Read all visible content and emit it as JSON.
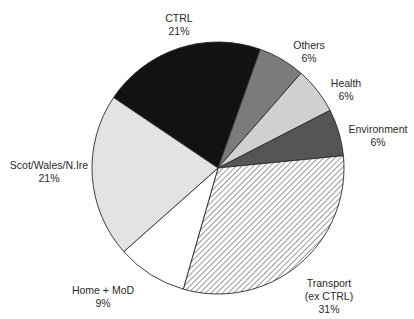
{
  "chart_data": {
    "type": "pie",
    "title": "",
    "start_angle_deg": 304,
    "direction": "clockwise",
    "slices": [
      {
        "label": "CTRL",
        "value": 21,
        "display": "21%",
        "color": "#121212",
        "pattern": "solid"
      },
      {
        "label": "Others",
        "value": 6,
        "display": "6%",
        "color": "#7b7b7b",
        "pattern": "solid"
      },
      {
        "label": "Health",
        "value": 6,
        "display": "6%",
        "color": "#d0d0d0",
        "pattern": "solid"
      },
      {
        "label": "Environment",
        "value": 6,
        "display": "6%",
        "color": "#555555",
        "pattern": "solid"
      },
      {
        "label": "Transport (ex CTRL)",
        "value": 31,
        "display": "31%",
        "color": "#ffffff",
        "pattern": "hatch"
      },
      {
        "label": "Home + MoD",
        "value": 9,
        "display": "9%",
        "color": "#ffffff",
        "pattern": "solid"
      },
      {
        "label": "Scot/Wales/N.Ire",
        "value": 21,
        "display": "21%",
        "color": "#e3e3e3",
        "pattern": "solid"
      }
    ]
  },
  "labels": {
    "ctrl": {
      "name": "CTRL",
      "pct": "21%"
    },
    "others": {
      "name": "Others",
      "pct": "6%"
    },
    "health": {
      "name": "Health",
      "pct": "6%"
    },
    "environment": {
      "name": "Environment",
      "pct": "6%"
    },
    "transport": {
      "name1": "Transport",
      "name2": "(ex CTRL)",
      "pct": "31%"
    },
    "home": {
      "name": "Home + MoD",
      "pct": "9%"
    },
    "scot": {
      "name": "Scot/Wales/N.Ire",
      "pct": "21%"
    }
  }
}
